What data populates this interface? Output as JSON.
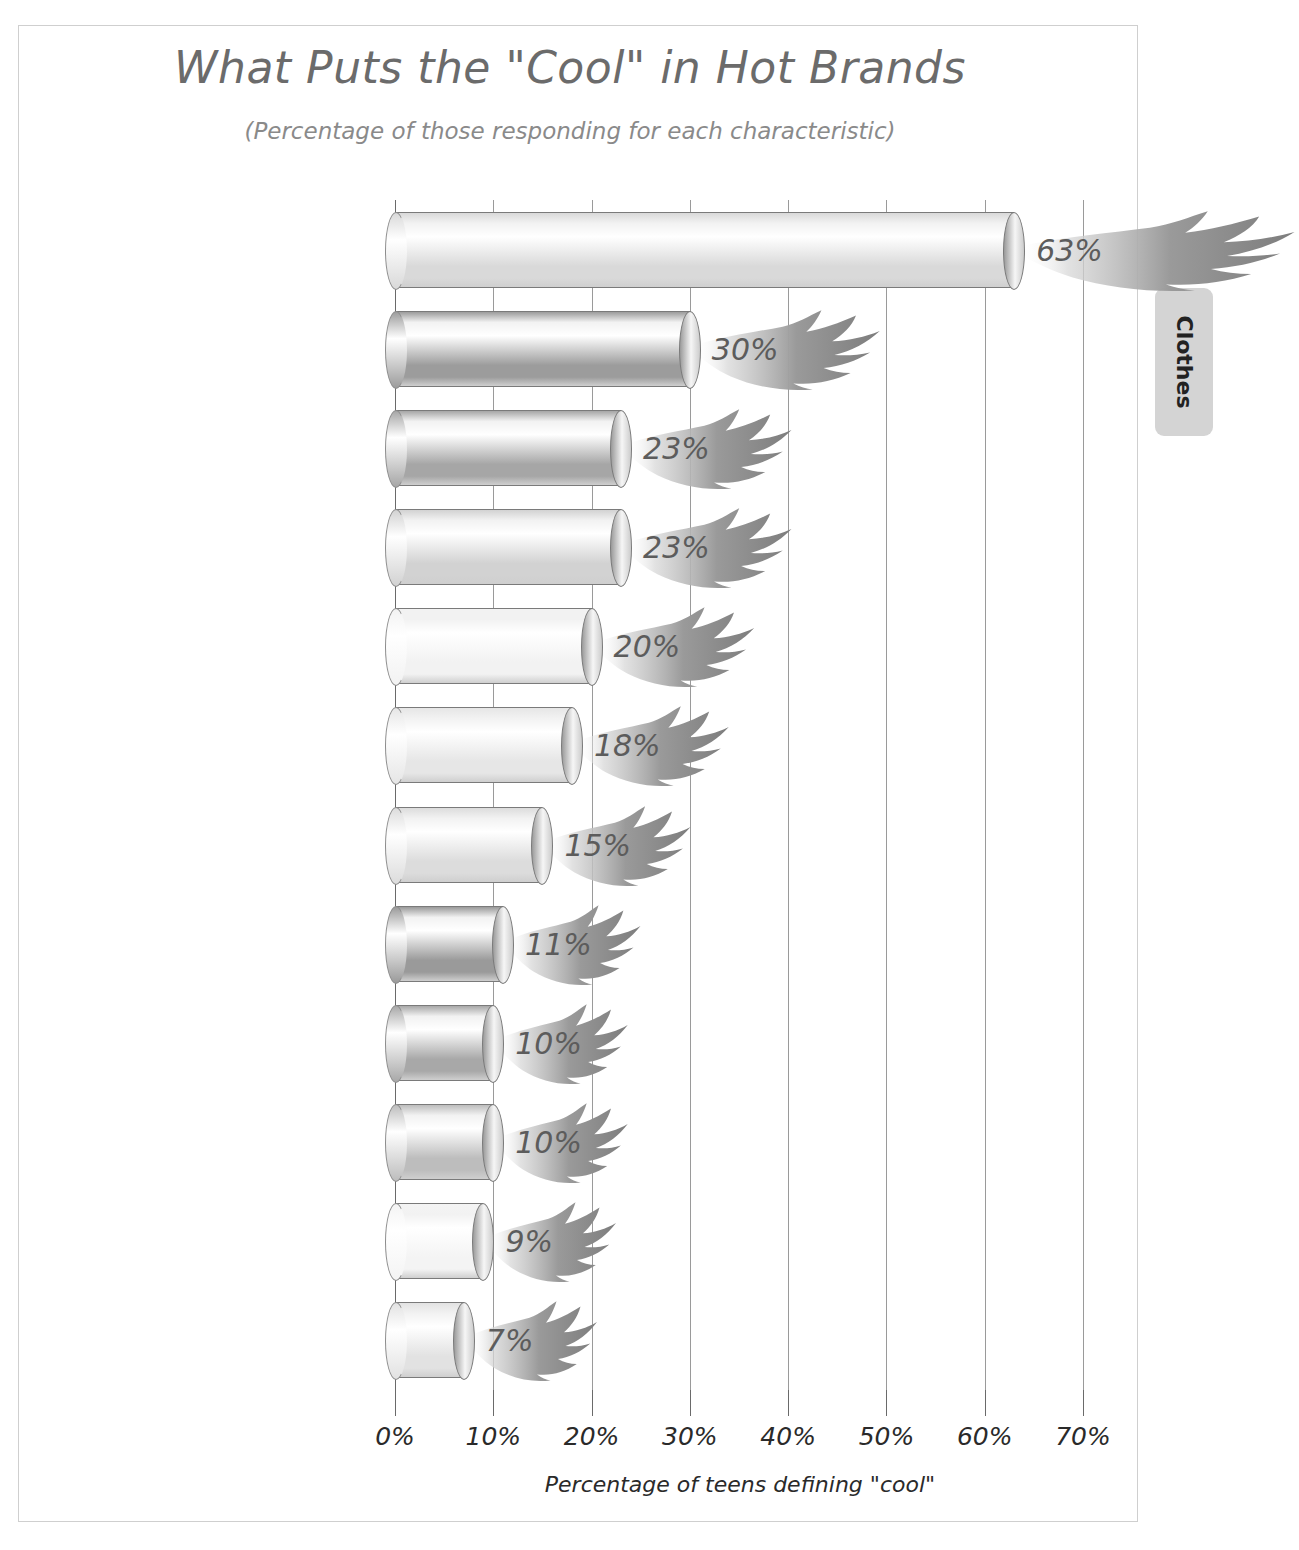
{
  "chart": {
    "title": "What Puts the \"Cool\" in Hot Brands",
    "subtitle": "(Percentage of those responding for each characteristic)"
  },
  "side_tab": {
    "label": "Clothes"
  },
  "chart_data": {
    "type": "bar",
    "orientation": "horizontal",
    "title": "What Puts the \"Cool\" in Hot Brands",
    "subtitle": "(Percentage of those responding for each characteristic)",
    "xlabel": "Percentage of teens defining \"cool\"",
    "ylabel": "",
    "xlim": [
      0,
      70
    ],
    "grid": true,
    "legend": false,
    "xticks": [
      "0%",
      "10%",
      "20%",
      "30%",
      "40%",
      "50%",
      "60%",
      "70%"
    ],
    "xtick_values": [
      0,
      10,
      20,
      30,
      40,
      50,
      60,
      70
    ],
    "categories": [
      "Quality",
      "For people my age",
      "It's unique",
      "Advertising",
      "\"Cool\" friends/peers use it",
      "Everyone uses it",
      "Around a long time",
      "Sold at cool store",
      "Expensive",
      "New brand",
      "Celebrity I admire uses it",
      "Packaging"
    ],
    "values": [
      63,
      30,
      23,
      23,
      20,
      18,
      15,
      11,
      10,
      10,
      9,
      7
    ],
    "data_labels": [
      "63%",
      "30%",
      "23%",
      "23%",
      "20%",
      "18%",
      "15%",
      "11%",
      "10%",
      "10%",
      "9%",
      "7%"
    ],
    "bar_shades": [
      "#d9d9d9",
      "#9c9c9c",
      "#a6a6a6",
      "#d2d2d2",
      "#f2f2f2",
      "#e6e6e6",
      "#dcdcdc",
      "#9a9a9a",
      "#a8a8a8",
      "#bdbdbd",
      "#f4f4f4",
      "#e2e2e2"
    ]
  },
  "colors": {
    "title_text": "#6b6b6b",
    "subtitle_text": "#8a8a8a",
    "category_text": "#2a2a2a",
    "value_label_text": "#5c5c5c",
    "gridline": "#9a9a9a",
    "frame_border": "#cfcfcf",
    "flame": "#8e8e8e",
    "side_tab_bg": "#d4d4d4"
  }
}
